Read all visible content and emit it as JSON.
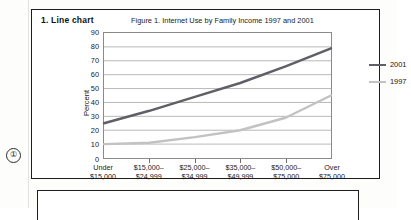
{
  "margin": {
    "callout_marker": "①"
  },
  "figure": {
    "number_label": "1.  Line chart",
    "caption": "Figure 1. Internet Use by Family Income 1997 and 2001"
  },
  "legend": {
    "position": "right",
    "entries": [
      {
        "label": "2001",
        "color": "#5f5f66"
      },
      {
        "label": "1997",
        "color": "#c2c2c4"
      }
    ]
  },
  "chart_data": {
    "type": "line",
    "title": "Figure 1. Internet Use by Family Income 1997 and 2001",
    "xlabel": "",
    "ylabel": "Percent",
    "ylim": [
      0,
      90
    ],
    "ytick_step": 10,
    "yticks": [
      90,
      80,
      70,
      60,
      50,
      40,
      30,
      20,
      10,
      0
    ],
    "grid": true,
    "legend_position": "right",
    "categories": [
      "Under\n$15,000",
      "$15,000–\n$24,999",
      "$25,000–\n$34,999",
      "$35,000–\n$49,999",
      "$50,000–\n$75,000",
      "Over\n$75,000"
    ],
    "categories_flat": [
      "Under $15,000",
      "$15,000–$24,999",
      "$25,000–$34,999",
      "$35,000–$49,999",
      "$50,000–$75,000",
      "Over $75,000"
    ],
    "series": [
      {
        "name": "2001",
        "color": "#5f5f66",
        "values": [
          25,
          34,
          44,
          54,
          66,
          79
        ]
      },
      {
        "name": "1997",
        "color": "#c2c2c4",
        "values": [
          10,
          11,
          15,
          20,
          29,
          45
        ]
      }
    ]
  },
  "axis": {
    "y_labels": [
      "90",
      "80",
      "70",
      "60",
      "50",
      "40",
      "30",
      "20",
      "10",
      "0"
    ],
    "y_title": "Percent",
    "x_labels": [
      {
        "line1": "Under",
        "line2": "$15,000"
      },
      {
        "line1": "$15,000–",
        "line2": "$24,999"
      },
      {
        "line1": "$25,000–",
        "line2": "$34,999"
      },
      {
        "line1": "$35,000–",
        "line2": "$49,999"
      },
      {
        "line1": "$50,000–",
        "line2": "$75,000"
      },
      {
        "line1": "Over",
        "line2": "$75,000"
      }
    ]
  }
}
